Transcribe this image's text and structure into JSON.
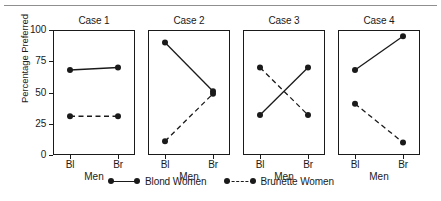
{
  "chart_data": {
    "type": "line",
    "title": "",
    "xlabel": "Men",
    "ylabel": "Percentage Preferred",
    "ylim": [
      0,
      100
    ],
    "yticks": [
      0,
      25,
      50,
      75,
      100
    ],
    "ytick_labels": [
      "0",
      "25",
      "50",
      "75",
      "100"
    ],
    "x": [
      "Bl",
      "Br"
    ],
    "xtick_labels": [
      "Bl",
      "Br"
    ],
    "grid": false,
    "legend_position": "bottom-center",
    "legend": [
      {
        "name": "Blond Women",
        "style": "solid",
        "marker": "filled-circle"
      },
      {
        "name": "Brunette Women",
        "style": "dashed",
        "marker": "filled-circle"
      }
    ],
    "panels": [
      {
        "title": "Case 1",
        "series": [
          {
            "name": "Blond Women",
            "style": "solid",
            "values": [
              68,
              70
            ]
          },
          {
            "name": "Brunette Women",
            "style": "dashed",
            "values": [
              31,
              31
            ]
          }
        ]
      },
      {
        "title": "Case 2",
        "series": [
          {
            "name": "Blond Women",
            "style": "solid",
            "values": [
              90,
              51
            ]
          },
          {
            "name": "Brunette Women",
            "style": "dashed",
            "values": [
              11,
              49
            ]
          }
        ]
      },
      {
        "title": "Case 3",
        "series": [
          {
            "name": "Blond Women",
            "style": "solid",
            "values": [
              32,
              70
            ]
          },
          {
            "name": "Brunette Women",
            "style": "dashed",
            "values": [
              70,
              32
            ]
          }
        ]
      },
      {
        "title": "Case 4",
        "series": [
          {
            "name": "Blond Women",
            "style": "solid",
            "values": [
              68,
              95
            ]
          },
          {
            "name": "Brunette Women",
            "style": "dashed",
            "values": [
              41,
              10
            ]
          }
        ]
      }
    ],
    "colors": {
      "line": "#1a1a1a",
      "axis": "#1a1a1a",
      "background": "#ffffff",
      "rule": "#8f8f8f"
    }
  }
}
